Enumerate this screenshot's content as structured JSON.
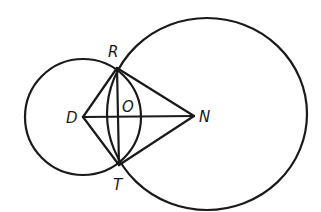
{
  "diagram": {
    "type": "geometry",
    "stroke_color": "#1a1a1a",
    "background": "#ffffff",
    "points": [
      {
        "id": "R",
        "label": "R",
        "x": 117,
        "y": 68
      },
      {
        "id": "T",
        "label": "T",
        "x": 119,
        "y": 165
      },
      {
        "id": "D",
        "label": "D",
        "x": 83,
        "y": 117
      },
      {
        "id": "N",
        "label": "N",
        "x": 194,
        "y": 116
      },
      {
        "id": "O",
        "label": "O",
        "x": 118,
        "y": 117
      }
    ],
    "circles": [
      {
        "id": "small-circle",
        "center": "D",
        "cx": 83,
        "cy": 117,
        "rx": 58,
        "ry": 58
      },
      {
        "id": "large-circle",
        "center": "N",
        "cx": 207,
        "cy": 114,
        "rx": 100,
        "ry": 96
      }
    ],
    "segments": [
      {
        "from": "D",
        "to": "R"
      },
      {
        "from": "D",
        "to": "T"
      },
      {
        "from": "N",
        "to": "R"
      },
      {
        "from": "N",
        "to": "T"
      },
      {
        "from": "R",
        "to": "T"
      },
      {
        "from": "D",
        "to": "N"
      }
    ],
    "labels": {
      "R": "R",
      "T": "T",
      "D": "D",
      "N": "N",
      "O": "O"
    }
  }
}
